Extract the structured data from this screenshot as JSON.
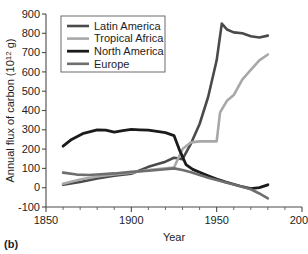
{
  "figure": {
    "panel_label": "(b)"
  },
  "chart_data": {
    "type": "line",
    "title": "",
    "xlabel": "Year",
    "ylabel": "Annual flux of carbon (10¹² g)",
    "ylabel_parts": {
      "prefix": "Annual flux of carbon (10",
      "exponent": "12",
      "suffix": " g)"
    },
    "xlim": [
      1850,
      2000
    ],
    "ylim": [
      -100,
      900
    ],
    "xticks": [
      1850,
      1900,
      1950,
      2000
    ],
    "xtick_labels": [
      "1850",
      "1900",
      "1950",
      "2000"
    ],
    "xminor_step": 10,
    "yticks": [
      -100,
      0,
      100,
      200,
      300,
      400,
      500,
      600,
      700,
      800,
      900
    ],
    "ytick_labels": [
      "-100",
      "0",
      "100",
      "200",
      "300",
      "400",
      "500",
      "600",
      "700",
      "800",
      "900"
    ],
    "grid": false,
    "legend_position": "upper-left-inside",
    "series": [
      {
        "name": "Latin America",
        "color": "#4a4a4a",
        "width": 2.6,
        "x": [
          1860,
          1870,
          1880,
          1890,
          1900,
          1910,
          1920,
          1925,
          1930,
          1935,
          1940,
          1945,
          1950,
          1953,
          1956,
          1960,
          1965,
          1970,
          1975,
          1980
        ],
        "y": [
          15,
          30,
          48,
          62,
          72,
          108,
          135,
          155,
          148,
          230,
          330,
          470,
          660,
          850,
          820,
          805,
          800,
          785,
          778,
          788
        ]
      },
      {
        "name": "Tropical Africa",
        "color": "#a8a8a8",
        "width": 2.6,
        "x": [
          1860,
          1870,
          1880,
          1890,
          1900,
          1910,
          1920,
          1925,
          1930,
          1935,
          1940,
          1945,
          1950,
          1952,
          1956,
          1960,
          1965,
          1970,
          1975,
          1980
        ],
        "y": [
          20,
          42,
          58,
          68,
          78,
          92,
          100,
          105,
          200,
          235,
          240,
          240,
          240,
          390,
          450,
          480,
          560,
          610,
          660,
          690
        ]
      },
      {
        "name": "North America",
        "color": "#1b1b1b",
        "width": 2.8,
        "x": [
          1860,
          1865,
          1872,
          1880,
          1885,
          1890,
          1895,
          1900,
          1905,
          1910,
          1915,
          1920,
          1925,
          1928,
          1932,
          1936,
          1940,
          1945,
          1950,
          1955,
          1960,
          1965,
          1970,
          1975,
          1980
        ],
        "y": [
          215,
          250,
          282,
          300,
          298,
          288,
          296,
          302,
          300,
          298,
          292,
          285,
          270,
          200,
          120,
          95,
          80,
          62,
          45,
          30,
          18,
          5,
          -5,
          0,
          15
        ]
      },
      {
        "name": "Europe",
        "color": "#6e6e6e",
        "width": 2.6,
        "x": [
          1860,
          1868,
          1875,
          1882,
          1890,
          1900,
          1910,
          1920,
          1925,
          1930,
          1935,
          1940,
          1945,
          1950,
          1955,
          1960,
          1965,
          1970,
          1975,
          1980
        ],
        "y": [
          78,
          68,
          66,
          70,
          74,
          82,
          88,
          96,
          100,
          92,
          80,
          66,
          52,
          40,
          28,
          16,
          5,
          -8,
          -30,
          -55
        ]
      }
    ]
  },
  "legend": {
    "items": [
      {
        "label": "Latin America"
      },
      {
        "label": "Tropical Africa"
      },
      {
        "label": "North America"
      },
      {
        "label": "Europe"
      }
    ]
  }
}
